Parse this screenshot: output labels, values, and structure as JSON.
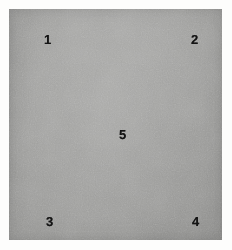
{
  "figure": {
    "title": "",
    "background_color": "#fdfdfc",
    "panel": {
      "name": "gray-specimen-panel",
      "base_color": "#9c9c9a",
      "surface": "uniform matte gray textured surface",
      "bounds_px": {
        "left": 9,
        "top": 9,
        "width": 213,
        "height": 231
      }
    }
  },
  "markers": [
    {
      "id": "marker-1",
      "label": "1",
      "position": "top-left",
      "x": 35,
      "y": 24,
      "color": "#141414"
    },
    {
      "id": "marker-2",
      "label": "2",
      "position": "top-right",
      "x": 182,
      "y": 24,
      "color": "#141414"
    },
    {
      "id": "marker-5",
      "label": "5",
      "position": "center",
      "x": 110,
      "y": 119,
      "color": "#141414"
    },
    {
      "id": "marker-3",
      "label": "3",
      "position": "bottom-left",
      "x": 37,
      "y": 206,
      "color": "#141414"
    },
    {
      "id": "marker-4",
      "label": "4",
      "position": "bottom-right",
      "x": 183,
      "y": 206,
      "color": "#141414"
    }
  ]
}
